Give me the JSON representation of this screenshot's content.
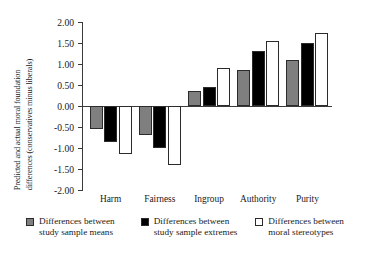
{
  "chart_data": {
    "type": "bar",
    "title": "",
    "subtitle": "",
    "xlabel": "",
    "ylabel": "Predicted and actual moral foundation differences (conservatives minus liberals)",
    "ylabel_lines": [
      "Predicted and actual moral foundation",
      "differences (conservatives minus liberals)"
    ],
    "categories": [
      "Harm",
      "Fairness",
      "Ingroup",
      "Authority",
      "Purity"
    ],
    "series": [
      {
        "name": "Differences between study sample means",
        "name_lines": [
          "Differences between",
          "study sample means"
        ],
        "color": "#7f7f7f",
        "values": [
          -0.55,
          -0.7,
          0.35,
          0.85,
          1.1
        ]
      },
      {
        "name": "Differences between study sample extremes",
        "name_lines": [
          "Differences between",
          "study sample extremes"
        ],
        "color": "#000000",
        "values": [
          -0.85,
          -1.0,
          0.45,
          1.3,
          1.5
        ]
      },
      {
        "name": "Differences between moral stereotypes",
        "name_lines": [
          "Differences between",
          "moral stereotypes"
        ],
        "color": "#ffffff",
        "values": [
          -1.15,
          -1.4,
          0.9,
          1.55,
          1.75
        ]
      }
    ],
    "ylim": [
      -2.0,
      2.0
    ],
    "yticks": [
      2.0,
      1.5,
      1.0,
      0.5,
      0.0,
      -0.5,
      -1.0,
      -1.5,
      -2.0
    ],
    "ytick_labels": [
      "2.00",
      "1.50",
      "1.00",
      "0.50",
      "0.00",
      "-0.50",
      "-1.00",
      "-1.50",
      "-2.00"
    ],
    "grid": false,
    "legend_position": "bottom"
  }
}
